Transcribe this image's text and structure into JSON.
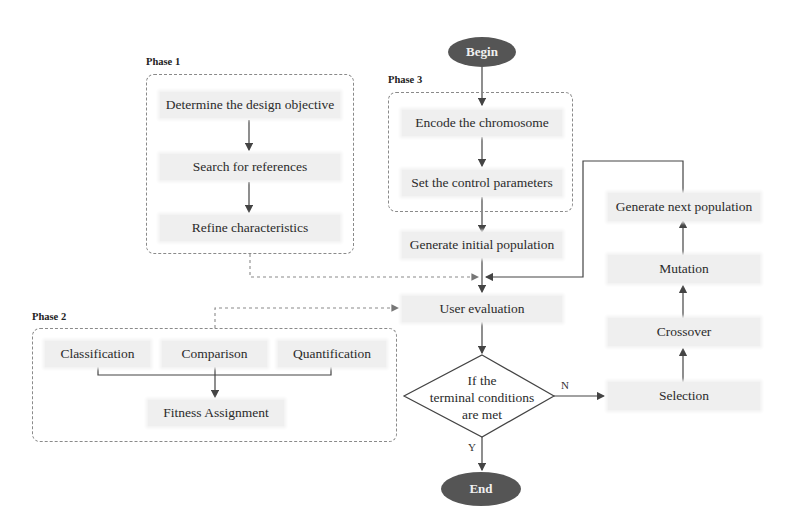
{
  "diagram": {
    "type": "flowchart",
    "start": {
      "label": "Begin"
    },
    "end": {
      "label": "End"
    },
    "phases": [
      {
        "label": "Phase 1",
        "steps": [
          "Determine the design objective",
          "Search for references",
          "Refine characteristics"
        ]
      },
      {
        "label": "Phase 2",
        "steps": [
          "Classification",
          "Comparison",
          "Quantification"
        ],
        "output": "Fitness Assignment"
      },
      {
        "label": "Phase 3",
        "steps": [
          "Encode the chromosome",
          "Set the control parameters"
        ]
      }
    ],
    "main_flow": {
      "initial_population": "Generate initial population",
      "user_evaluation": "User evaluation",
      "decision": {
        "line1": "If the",
        "line2": "terminal conditions",
        "line3": "are met",
        "yes_label": "Y",
        "no_label": "N"
      }
    },
    "ga_loop": {
      "selection": "Selection",
      "crossover": "Crossover",
      "mutation": "Mutation",
      "next_population": "Generate next population"
    },
    "colors": {
      "node_fill": "#efefef",
      "terminal_fill": "#555555",
      "line": "#444444",
      "dashed_line": "#8a8a8a"
    }
  }
}
